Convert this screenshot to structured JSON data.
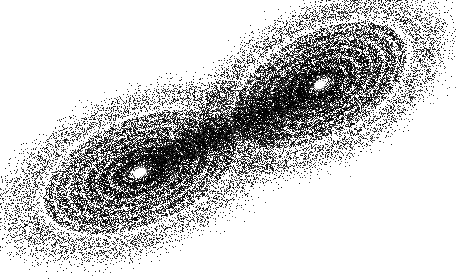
{
  "image": {
    "description": "Dense black point-cloud of a two-lobed strange attractor (Lorenz-like butterfly) on white background, viewed obliquely so the lobes run from lower-left to upper-right",
    "width": 456,
    "height": 279,
    "background": "#ffffff",
    "ink": "#000000"
  },
  "lobes": [
    {
      "name": "left-lobe",
      "center": [
        140,
        172
      ],
      "eye_size": [
        14,
        9
      ],
      "outer_radius": [
        135,
        70
      ],
      "rotation_deg": -22,
      "ring_count": 9
    },
    {
      "name": "right-lobe",
      "center": [
        320,
        85
      ],
      "eye_size": [
        12,
        8
      ],
      "outer_radius": [
        125,
        68
      ],
      "rotation_deg": -28,
      "ring_count": 9
    }
  ],
  "render": {
    "points": 70000,
    "seed": 7
  }
}
